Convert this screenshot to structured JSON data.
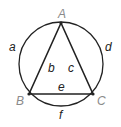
{
  "diagram": {
    "vertices": [
      {
        "id": "A",
        "label": "A"
      },
      {
        "id": "B",
        "label": "B"
      },
      {
        "id": "C",
        "label": "C"
      }
    ],
    "triangle_sides": [
      {
        "label": "b",
        "from": "A",
        "to": "B"
      },
      {
        "label": "c",
        "from": "A",
        "to": "C"
      },
      {
        "label": "e",
        "from": "B",
        "to": "C"
      }
    ],
    "arcs": [
      {
        "label": "a",
        "from": "A",
        "to": "B"
      },
      {
        "label": "d",
        "from": "A",
        "to": "C"
      },
      {
        "label": "f",
        "from": "B",
        "to": "C"
      }
    ],
    "colors": {
      "stroke": "#222222",
      "vertex_label": "#8a8a8a",
      "edge_label": "#222222"
    }
  }
}
